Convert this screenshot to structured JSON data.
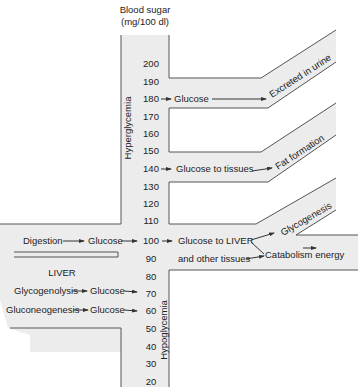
{
  "header": {
    "title_line1": "Blood sugar",
    "title_line2": "(mg/100 dl)"
  },
  "scale": {
    "ticks": [
      "200",
      "190",
      "180",
      "170",
      "160",
      "150",
      "140",
      "130",
      "120",
      "110",
      "100",
      "90",
      "80",
      "70",
      "60",
      "50",
      "40",
      "30",
      "20"
    ]
  },
  "zones": {
    "hyper": "Hyperglycemia",
    "hypo": "Hypoglycemia"
  },
  "branches": {
    "urine": {
      "source": "Glucose",
      "dest": "Excreted in urine"
    },
    "fat": {
      "source": "Glucose to tissues",
      "dest": "Fat formation"
    },
    "liver": {
      "source_line1": "Glucose to LIVER",
      "source_line2": "and other tissues",
      "dest1": "Glycogenesis",
      "dest2": "Catabolism energy"
    }
  },
  "inputs": {
    "digestion": "Digestion",
    "digestion_out": "Glucose",
    "liver_title": "LIVER",
    "glycogenolysis": "Glycogenolysis",
    "glycogenolysis_out": "Glucose",
    "gluconeogenesis": "Gluconeogenesis",
    "gluconeogenesis_out": "Glucose"
  },
  "colors": {
    "band": "#ececec",
    "line": "#555555",
    "text": "#222222"
  }
}
